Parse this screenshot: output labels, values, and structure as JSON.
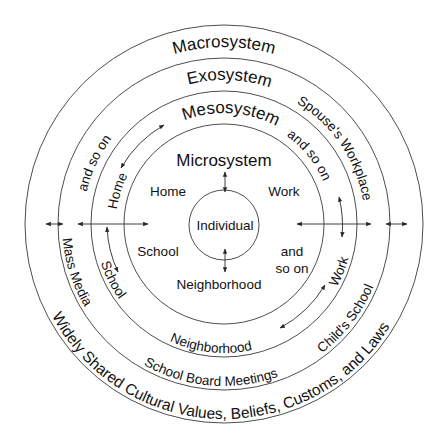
{
  "diagram": {
    "center": {
      "x": 224,
      "y": 224
    },
    "colors": {
      "line": "#3a3a3a",
      "text": "#111111",
      "background": "#ffffff"
    },
    "layers": [
      {
        "name": "Individual",
        "radius": 35
      },
      {
        "name": "Microsystem",
        "radius": 100
      },
      {
        "name": "Mesosystem",
        "radius": 133
      },
      {
        "name": "Exosystem",
        "radius": 166
      },
      {
        "name": "Macrosystem",
        "radius": 199
      }
    ],
    "individual": {
      "label": "Individual"
    },
    "microsystem": {
      "title": "Microsystem",
      "items": [
        "Home",
        "Work",
        "School",
        "Neighborhood"
      ],
      "more": [
        "and",
        "so on"
      ]
    },
    "mesosystem": {
      "title": "Mesosystem",
      "items": [
        "Home",
        "and so on",
        "School",
        "Neighborhood",
        "Work"
      ]
    },
    "exosystem": {
      "title": "Exosystem",
      "items": [
        "and so on",
        "Spouse's Workplace",
        "Mass Media",
        "School Board Meetings",
        "Child's School"
      ]
    },
    "macrosystem": {
      "title": "Macrosystem",
      "description": "Widely Shared Cultural Values, Beliefs, Customs, and Laws"
    }
  }
}
